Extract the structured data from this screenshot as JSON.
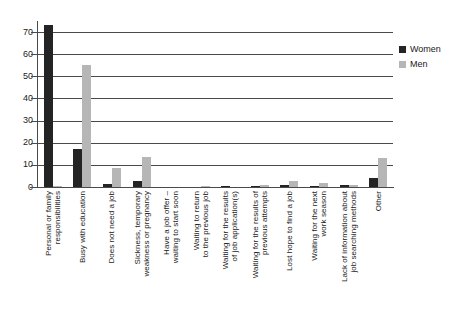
{
  "chart_data": {
    "type": "bar",
    "title": "",
    "xlabel": "",
    "ylabel": "",
    "ylim": [
      0,
      75
    ],
    "yticks": [
      0,
      10,
      20,
      30,
      40,
      50,
      60,
      70
    ],
    "grid": true,
    "legend_position": "top-right",
    "categories": [
      "Personal or family\nresponsibilities",
      "Busy with education",
      "Does not need a job",
      "Sickness, temporary\nweakness or pregnancy",
      "Have a job offer –\nwaiting to start soon",
      "Waiting to return\nto the previous job",
      "Waiting for the results\nof job application(s)",
      "Waiting for the results of\nprevious attempts",
      "Lost hope to find a job",
      "Waiting for the next\nwork season",
      "Lack of information about\njob searching methods",
      "Other"
    ],
    "series": [
      {
        "name": "Women",
        "color": "#242424",
        "values": [
          73.0,
          17.3,
          1.4,
          2.5,
          0.0,
          0.0,
          0.2,
          0.3,
          1.1,
          0.2,
          0.8,
          3.9
        ]
      },
      {
        "name": "Men",
        "color": "#b6b6b6",
        "values": [
          0.4,
          55.3,
          8.6,
          13.6,
          0.0,
          0.6,
          0.0,
          0.9,
          2.7,
          1.6,
          0.8,
          13.0
        ]
      }
    ]
  },
  "legend": {
    "items": [
      {
        "label": "Women",
        "color": "#242424"
      },
      {
        "label": "Men",
        "color": "#b6b6b6"
      }
    ]
  },
  "colors": {
    "women": "#242424",
    "men": "#b6b6b6",
    "axis": "#4a4a4a",
    "background": "#ffffff"
  }
}
